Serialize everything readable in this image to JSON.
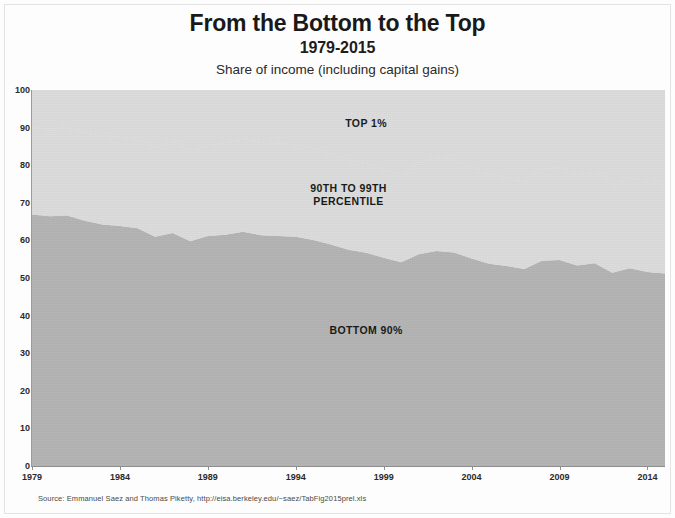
{
  "header": {
    "title": "From the Bottom to the Top",
    "subtitle": "1979-2015",
    "note": "Share of income (including capital gains)"
  },
  "source": {
    "text": "Source: Emmanuel Saez and Thomas Piketty, http://eisa.berkeley.edu/~saez/TabFig2015prel.xls"
  },
  "colors": {
    "bottom90_fill": "#b4b4b4",
    "upper_fill": "#dcdcdc",
    "axis": "#8f8f8f",
    "text": "#1a1a1a",
    "plot_background": "#e9e9e9"
  },
  "chart_data": {
    "type": "area",
    "title": "From the Bottom to the Top",
    "subtitle": "1979-2015",
    "ylabel": "Share of income (including capital gains)",
    "xlabel": "",
    "grid": false,
    "legend_position": "in-plot labels",
    "stacked": true,
    "stack_total": 100,
    "ylim": [
      0,
      100
    ],
    "xlim": [
      1979,
      2015
    ],
    "y_ticks": [
      0,
      10,
      20,
      30,
      40,
      50,
      60,
      70,
      80,
      90,
      100
    ],
    "x_ticks": [
      1979,
      1984,
      1989,
      1994,
      1999,
      2004,
      2009,
      2014
    ],
    "x": [
      1979,
      1980,
      1981,
      1982,
      1983,
      1984,
      1985,
      1986,
      1987,
      1988,
      1989,
      1990,
      1991,
      1992,
      1993,
      1994,
      1995,
      1996,
      1997,
      1998,
      1999,
      2000,
      2001,
      2002,
      2003,
      2004,
      2005,
      2006,
      2007,
      2008,
      2009,
      2010,
      2011,
      2012,
      2013,
      2014,
      2015
    ],
    "series": [
      {
        "name": "BOTTOM 90%",
        "label": "BOTTOM 90%",
        "color": "#b4b4b4",
        "values": [
          66.9,
          66.4,
          66.6,
          65.2,
          64.2,
          63.8,
          63.2,
          61.0,
          62.0,
          59.8,
          61.2,
          61.5,
          62.3,
          61.4,
          61.2,
          61.0,
          60.1,
          58.9,
          57.5,
          56.7,
          55.4,
          54.2,
          56.3,
          57.2,
          56.8,
          55.2,
          53.8,
          53.2,
          52.4,
          54.6,
          54.8,
          53.3,
          53.9,
          51.4,
          52.6,
          51.6,
          51.2
        ]
      },
      {
        "name": "90TH TO 99TH PERCENTILE",
        "label": "90TH TO 99TH\nPERCENTILE",
        "color": "#dcdcdc",
        "values": [
          23.1,
          23.3,
          23.4,
          23.5,
          23.6,
          23.7,
          23.9,
          23.6,
          24.3,
          23.7,
          24.2,
          24.4,
          24.8,
          24.5,
          24.6,
          24.6,
          24.5,
          24.2,
          23.9,
          23.8,
          23.5,
          23.2,
          24.2,
          24.9,
          24.8,
          24.3,
          23.8,
          23.5,
          23.1,
          24.3,
          24.7,
          24.1,
          24.6,
          23.4,
          24.1,
          23.7,
          23.6
        ]
      },
      {
        "name": "TOP 1%",
        "label": "TOP 1%",
        "color": "#dcdcdc",
        "values": [
          10.0,
          10.3,
          10.0,
          11.3,
          12.2,
          12.5,
          12.9,
          15.4,
          13.7,
          16.5,
          14.6,
          14.1,
          12.9,
          14.1,
          14.2,
          14.4,
          15.4,
          16.9,
          18.6,
          19.5,
          21.1,
          22.6,
          19.5,
          17.9,
          18.4,
          20.5,
          22.4,
          23.3,
          24.5,
          21.1,
          20.5,
          22.6,
          21.5,
          25.2,
          23.3,
          24.7,
          25.2
        ]
      }
    ],
    "annotations": [
      {
        "text": "TOP 1%",
        "x": 1998,
        "y": 91
      },
      {
        "text": "90TH TO 99TH\nPERCENTILE",
        "x": 1997,
        "y": 72
      },
      {
        "text": "BOTTOM 90%",
        "x": 1998,
        "y": 36
      }
    ]
  }
}
